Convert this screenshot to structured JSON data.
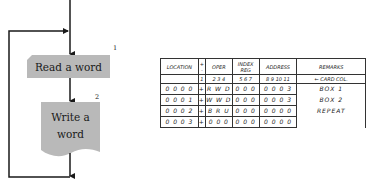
{
  "flowchart": {
    "boxes": [
      {
        "number": "1",
        "label": "Read a word",
        "shape": "card",
        "fill": "#b9b9b9"
      },
      {
        "number": "2",
        "label_line1": "Write a",
        "label_line2": "word",
        "shape": "document",
        "fill": "#b9b9b9"
      }
    ],
    "line_color": "#1a1a1a"
  },
  "table": {
    "headers": [
      "LOCATION",
      "+\n-",
      "OPER",
      "INDEX REG",
      "ADDRESS",
      "REMARKS"
    ],
    "sign_header_top": "+",
    "sign_header_bottom": "-",
    "card_col_numbers": {
      "sign": "1",
      "oper": "2 3 4",
      "index": "5 6 7",
      "address": "8 9 10 11"
    },
    "card_col_label": "← CARD COL.",
    "rows": [
      {
        "location": "0 0 0 0",
        "sign": "+",
        "oper": "R W D",
        "index": "0 0 0",
        "address": "0 0 0 3",
        "remarks": "BOX 1"
      },
      {
        "location": "0 0 0 1",
        "sign": "+",
        "oper": "W W D",
        "index": "0 0 0",
        "address": "0 0 0 3",
        "remarks": "BOX 2"
      },
      {
        "location": "0 0 0 2",
        "sign": "+",
        "oper": "B R U",
        "index": "0 0 0",
        "address": "0 0 0 0",
        "remarks": "REPEAT"
      },
      {
        "location": "0 0 0 3",
        "sign": "+",
        "oper": "0 0 0",
        "index": "0 0 0",
        "address": "0 0 0 0",
        "remarks": ""
      }
    ]
  }
}
